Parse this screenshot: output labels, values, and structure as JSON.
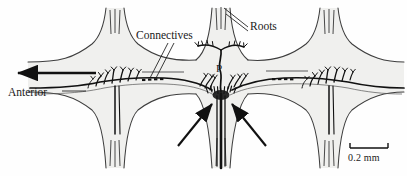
{
  "figure": {
    "background_color": "#fefefe",
    "ink_color": "#1a1a1a",
    "tissue_fill": "#f0f0ee",
    "tissue_outline": "#4a4a4a"
  },
  "labels": {
    "connectives": "Connectives",
    "roots": "Roots",
    "anterior": "Anterior",
    "neuron_p": "P"
  },
  "scale_bar": {
    "text": "0.2 mm",
    "length_px": 38
  },
  "annotations": {
    "anterior_arrow_direction": "left",
    "synapse_arrows_count": 2,
    "leader_lines": {
      "connectives": 2,
      "roots": 2
    }
  },
  "structures": {
    "ganglia_count": 3,
    "ganglia_labels": [
      "left-ganglion",
      "central-ganglion",
      "right-ganglion"
    ],
    "connective_segments": 2,
    "axon_break_marks": 2,
    "stained_neurons": [
      "left-neuron",
      "central-p-neuron",
      "right-neuron"
    ]
  }
}
